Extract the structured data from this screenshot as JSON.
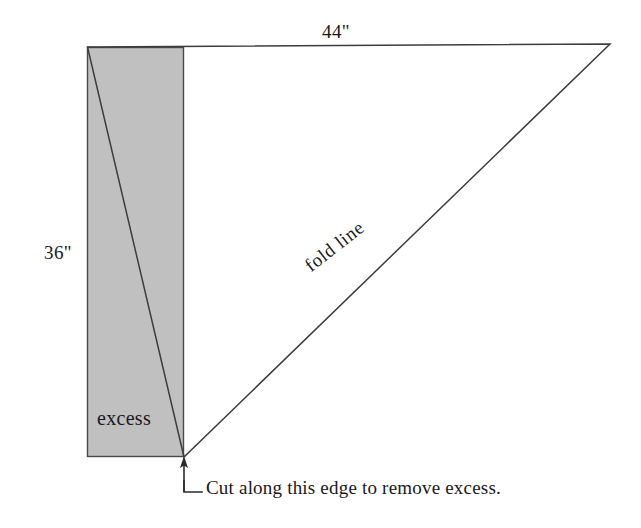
{
  "figure": {
    "background_color": "#ffffff",
    "line_color": "#3d3d3d",
    "text_color": "#1a1a1a"
  },
  "shapes": {
    "excess_rectangle": {
      "name": "excess-region",
      "fill_color": "#c0c0c0",
      "stroke_color": "#4a4a4a",
      "x": 87,
      "y": 47,
      "width": 97,
      "height": 410
    },
    "triangle": {
      "name": "fabric-triangle",
      "stroke_color": "#3d3d3d",
      "fill_color": "none",
      "points": "87,47 610,44 184,457"
    },
    "leader": {
      "name": "cut-leader-line",
      "stroke_color": "#3d3d3d",
      "arrow_tip_x": 184,
      "arrow_tip_y": 458,
      "shaft_bottom_y": 492,
      "elbow_x": 184,
      "elbow_y": 492,
      "horizontal_end_x": 202
    }
  },
  "labels": {
    "top_dimension": "44\"",
    "side_dimension": "36\"",
    "excess": "excess",
    "fold_line": "fold line",
    "cut_caption": "Cut along this edge to remove excess."
  },
  "measurements": {
    "top_edge_inches": 44,
    "left_edge_inches": 36,
    "unit": "inches"
  }
}
